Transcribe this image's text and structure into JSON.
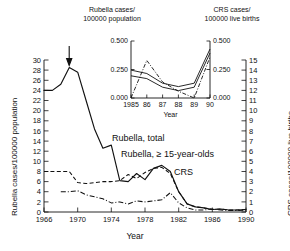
{
  "figure": {
    "top_label_left": "Rubella cases/\n100000 population",
    "top_label_left_line1": "Rubella cases/",
    "top_label_left_line2": "100000 population",
    "top_label_right_line1": "CRS cases/",
    "top_label_right_line2": "100000 live births",
    "left_axis_title": "Rubella cases/100000 population",
    "right_axis_title": "CRS cases/100000 live births",
    "x_axis_title": "Year",
    "annotations": {
      "rubella_total": "Rubella, total",
      "rubella_15": "Rubella, ≥ 15-year-olds",
      "crs": "CRS",
      "arrow": "vaccine-introduction-arrow"
    }
  },
  "chart_data": {
    "type": "line",
    "title": "",
    "xlabel": "Year",
    "ylabel": "Rubella cases/100000 population",
    "y2label": "CRS cases/100000 live births",
    "xlim": [
      1966,
      1990
    ],
    "ylim": [
      0,
      30
    ],
    "y2lim": [
      0,
      15
    ],
    "xticks": [
      1966,
      1970,
      1974,
      1978,
      1982,
      1986,
      1990
    ],
    "xticklabels": [
      "1966",
      "1970",
      "1974",
      "1978",
      "1982",
      "1986",
      "1990"
    ],
    "yticks": [
      0,
      2,
      4,
      6,
      8,
      10,
      12,
      14,
      16,
      18,
      20,
      22,
      24,
      26,
      28,
      30
    ],
    "yticklabels": [
      "0",
      "2",
      "4",
      "6",
      "8",
      "10",
      "12",
      "14",
      "16",
      "18",
      "20",
      "22",
      "24",
      "26",
      "28",
      "30"
    ],
    "y2ticks": [
      0,
      1,
      2,
      3,
      4,
      5,
      6,
      7,
      8,
      9,
      10,
      11,
      12,
      13,
      14,
      15
    ],
    "y2ticklabels": [
      "0",
      "1",
      "2",
      "3",
      "4",
      "5",
      "6",
      "7",
      "8",
      "9",
      "10",
      "11",
      "12",
      "13",
      "14",
      "15"
    ],
    "grid": false,
    "legend": "inline-annotations",
    "annotation_arrow_x": 1969,
    "series": [
      {
        "name": "Rubella, total",
        "style": "solid",
        "axis": "left",
        "x": [
          1966,
          1967,
          1968,
          1969,
          1970,
          1971,
          1972,
          1973,
          1974,
          1975,
          1976,
          1977,
          1978,
          1979,
          1980,
          1981,
          1982,
          1983,
          1984,
          1985,
          1986,
          1987,
          1988,
          1989,
          1990
        ],
        "values": [
          24.0,
          24.0,
          25.2,
          28.5,
          27.6,
          22.0,
          16.4,
          12.6,
          13.2,
          6.2,
          6.0,
          7.6,
          6.4,
          8.6,
          9.2,
          8.0,
          4.0,
          1.6,
          1.0,
          0.8,
          0.5,
          0.6,
          0.4,
          0.4,
          0.5
        ]
      },
      {
        "name": "Rubella, ≥ 15-year-olds",
        "style": "dashed",
        "axis": "left",
        "x": [
          1966,
          1967,
          1968,
          1969,
          1970,
          1971,
          1972,
          1973,
          1974,
          1975,
          1976,
          1977,
          1978,
          1979,
          1980,
          1981,
          1982,
          1983,
          1984,
          1985,
          1986,
          1987,
          1988,
          1989,
          1990
        ],
        "values": [
          8.0,
          8.0,
          8.0,
          8.0,
          5.8,
          5.6,
          5.8,
          6.0,
          6.0,
          6.2,
          7.4,
          6.6,
          7.8,
          8.6,
          8.8,
          7.6,
          4.0,
          1.6,
          1.0,
          0.8,
          0.5,
          0.6,
          0.4,
          0.4,
          0.5
        ]
      },
      {
        "name": "CRS",
        "style": "dash-dot",
        "axis": "right",
        "x": [
          1968,
          1969,
          1970,
          1971,
          1972,
          1973,
          1974,
          1975,
          1976,
          1977,
          1978,
          1979,
          1980,
          1981,
          1982,
          1983,
          1984,
          1985,
          1986,
          1987,
          1988,
          1989,
          1990
        ],
        "values": [
          2.0,
          2.0,
          2.1,
          1.7,
          1.5,
          1.3,
          0.9,
          1.0,
          0.8,
          1.1,
          1.0,
          1.1,
          1.2,
          1.9,
          0.9,
          0.4,
          0.2,
          0.2,
          0.3,
          0.2,
          0.15,
          0.15,
          0.2
        ]
      }
    ],
    "inset": {
      "type": "line",
      "xlabel": "Year",
      "xlim": [
        1985,
        1990
      ],
      "ylim": [
        0.0,
        0.5
      ],
      "xticks": [
        1985,
        1986,
        1987,
        1988,
        1989,
        1990
      ],
      "xticklabels": [
        "1985",
        "86",
        "87",
        "88",
        "89",
        "90"
      ],
      "yticks": [
        0.0,
        0.25,
        0.5
      ],
      "yticklabels": [
        "0.000",
        "0.250",
        "0.500"
      ],
      "y2ticklabels": [
        "0.000",
        "0.250",
        "0.500"
      ],
      "series": [
        {
          "name": "Rubella, total",
          "style": "solid",
          "x": [
            1985,
            1986,
            1987,
            1988,
            1989,
            1990
          ],
          "values": [
            0.245,
            0.215,
            0.13,
            0.1,
            0.13,
            0.43
          ]
        },
        {
          "name": "Rubella, ≥ 15-year-olds",
          "style": "solid",
          "x": [
            1985,
            1986,
            1987,
            1988,
            1989,
            1990
          ],
          "values": [
            0.195,
            0.17,
            0.095,
            0.065,
            0.095,
            0.395
          ]
        },
        {
          "name": "CRS",
          "style": "dash-dot",
          "x": [
            1985,
            1986,
            1987,
            1988,
            1989,
            1990
          ],
          "values": [
            0.0,
            0.33,
            0.14,
            0.06,
            0.0,
            0.36
          ]
        }
      ]
    }
  }
}
